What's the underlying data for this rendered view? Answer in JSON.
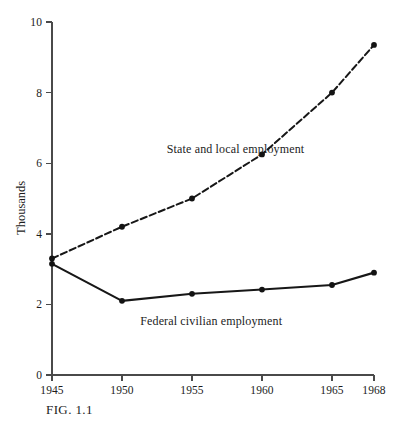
{
  "figure": {
    "caption": "FIG.  1.1"
  },
  "chart_data": {
    "type": "line",
    "title": "",
    "subtitle": "",
    "xlabel": "",
    "ylabel": "Thousands",
    "x": [
      1945,
      1950,
      1955,
      1960,
      1965,
      1968
    ],
    "xtick_labels": [
      "1945",
      "1950",
      "1955",
      "1960",
      "1965",
      "1968"
    ],
    "ytick_labels": [
      "0",
      "2",
      "4",
      "6",
      "8",
      "10"
    ],
    "ytick_values": [
      0,
      2,
      4,
      6,
      8,
      10
    ],
    "xlim": [
      1945,
      1968
    ],
    "ylim": [
      0,
      10
    ],
    "grid": false,
    "legend_position": "inline-annotation",
    "series": [
      {
        "name": "State and local employment",
        "style": "dashed",
        "marker": "circle",
        "values": [
          3.3,
          4.2,
          5.0,
          6.25,
          8.0,
          9.35
        ]
      },
      {
        "name": "Federal civilian employment",
        "style": "solid",
        "marker": "circle",
        "values": [
          3.15,
          2.1,
          2.3,
          2.42,
          2.55,
          2.9
        ]
      }
    ],
    "annotations": [
      {
        "text": "State and local employment",
        "x": 1953.2,
        "y": 6.6
      },
      {
        "text": "Federal civilian employment",
        "x": 1951.3,
        "y": 1.72
      }
    ],
    "colors": {
      "line": "#171717",
      "axis": "#4a4a4a",
      "background": "#ffffff",
      "text": "#1c1c1c"
    }
  }
}
